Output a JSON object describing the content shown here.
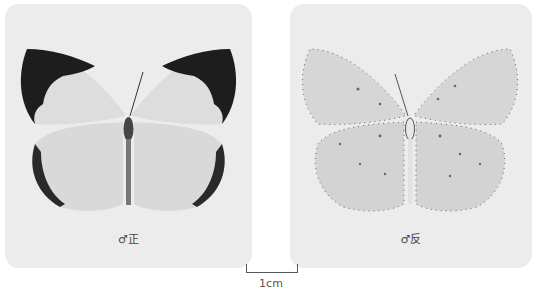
{
  "panels": [
    {
      "id": "upperside",
      "caption": "♂正",
      "view": "upperside (dorsal)"
    },
    {
      "id": "underside",
      "caption": "♂反",
      "view": "underside (ventral)"
    }
  ],
  "scale_bar": {
    "label": "1cm"
  },
  "colors": {
    "background": "#ffffff",
    "panel": "#ececec",
    "wing": "#dcdcdc",
    "wing_border": "#1a1a1a"
  }
}
